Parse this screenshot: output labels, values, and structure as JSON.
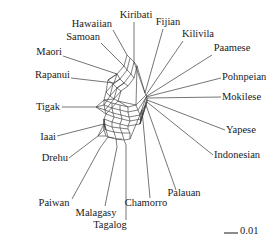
{
  "figure": {
    "type": "phylogenetic-split-network",
    "background_color": "#ffffff",
    "line_color": "#3a3a3a",
    "text_color": "#1a1a1a"
  },
  "chart_data": {
    "type": "scatter",
    "title": "",
    "xlabel": "",
    "ylabel": "",
    "grid": false,
    "legend": null,
    "network_style": "neighbor-net splits graph",
    "scale_bar": {
      "label": "0.01",
      "length_px": 14
    },
    "categories": [
      "Hawaiian",
      "Samoan",
      "Maori",
      "Rapanui",
      "Tigak",
      "Kiribati",
      "Fijian",
      "Kilivila",
      "Paamese",
      "Pohnpeian",
      "Mokilese",
      "Yapese",
      "Indonesian",
      "Palauan",
      "Chamorro",
      "Tagalog",
      "Malagasy",
      "Paiwan",
      "Drehu",
      "Iaai"
    ],
    "taxa": [
      {
        "name": "Hawaiian",
        "label_x": 112,
        "label_y": 27,
        "label_anchor": "right",
        "leader": [
          [
            113,
            30
          ],
          [
            127,
            55
          ]
        ],
        "tip": [
          127,
          55
        ]
      },
      {
        "name": "Samoan",
        "label_x": 100,
        "label_y": 40,
        "label_anchor": "right",
        "leader": [
          [
            101,
            43
          ],
          [
            124,
            66
          ]
        ],
        "tip": [
          124,
          66
        ]
      },
      {
        "name": "Maori",
        "label_x": 62,
        "label_y": 55,
        "label_anchor": "right",
        "leader": [
          [
            63,
            56
          ],
          [
            117,
            74
          ]
        ],
        "tip": [
          117,
          74
        ]
      },
      {
        "name": "Rapanui",
        "label_x": 70,
        "label_y": 78,
        "label_anchor": "right",
        "leader": [
          [
            71,
            78
          ],
          [
            114,
            83
          ]
        ],
        "tip": [
          114,
          83
        ]
      },
      {
        "name": "Tigak",
        "label_x": 60,
        "label_y": 110,
        "label_anchor": "right",
        "leader": [
          [
            62,
            107
          ],
          [
            96,
            107
          ]
        ],
        "tip": [
          96,
          107
        ]
      },
      {
        "name": "Kiribati",
        "label_x": 136,
        "label_y": 18,
        "label_anchor": "center",
        "leader": [
          [
            134,
            22
          ],
          [
            134,
            62
          ]
        ],
        "tip": [
          134,
          62
        ]
      },
      {
        "name": "Fijian",
        "label_x": 168,
        "label_y": 25,
        "label_anchor": "center",
        "leader": [
          [
            163,
            29
          ],
          [
            145,
            93
          ]
        ],
        "tip": [
          145,
          93
        ]
      },
      {
        "name": "Kilivila",
        "label_x": 198,
        "label_y": 37,
        "label_anchor": "center",
        "leader": [
          [
            183,
            41
          ],
          [
            146,
            95
          ]
        ],
        "tip": [
          146,
          95
        ]
      },
      {
        "name": "Paamese",
        "label_x": 232,
        "label_y": 51,
        "label_anchor": "center",
        "leader": [
          [
            212,
            55
          ],
          [
            147,
            96
          ]
        ],
        "tip": [
          147,
          96
        ]
      },
      {
        "name": "Pohnpeian",
        "label_x": 222,
        "label_y": 80,
        "label_anchor": "left",
        "leader": [
          [
            221,
            78
          ],
          [
            146,
            97
          ]
        ],
        "tip": [
          146,
          97
        ]
      },
      {
        "name": "Mokilese",
        "label_x": 222,
        "label_y": 100,
        "label_anchor": "left",
        "leader": [
          [
            221,
            97
          ],
          [
            147,
            98
          ]
        ],
        "tip": [
          147,
          98
        ]
      },
      {
        "name": "Yapese",
        "label_x": 226,
        "label_y": 133,
        "label_anchor": "left",
        "leader": [
          [
            225,
            130
          ],
          [
            147,
            100
          ]
        ],
        "tip": [
          147,
          100
        ]
      },
      {
        "name": "Indonesian",
        "label_x": 214,
        "label_y": 158,
        "label_anchor": "left",
        "leader": [
          [
            213,
            155
          ],
          [
            147,
            102
          ]
        ],
        "tip": [
          147,
          102
        ]
      },
      {
        "name": "Palauan",
        "label_x": 184,
        "label_y": 196,
        "label_anchor": "center",
        "leader": [
          [
            176,
            190
          ],
          [
            146,
            105
          ]
        ],
        "tip": [
          146,
          105
        ]
      },
      {
        "name": "Chamorro",
        "label_x": 146,
        "label_y": 206,
        "label_anchor": "center",
        "leader": [
          [
            150,
            198
          ],
          [
            142,
            110
          ]
        ],
        "tip": [
          142,
          110
        ]
      },
      {
        "name": "Tagalog",
        "label_x": 110,
        "label_y": 228,
        "label_anchor": "center",
        "leader": [
          [
            126,
            220
          ],
          [
            126,
            145
          ]
        ],
        "tip": [
          126,
          145
        ]
      },
      {
        "name": "Malagasy",
        "label_x": 96,
        "label_y": 216,
        "label_anchor": "center",
        "leader": [
          [
            105,
            206
          ],
          [
            117,
            147
          ]
        ],
        "tip": [
          117,
          147
        ]
      },
      {
        "name": "Paiwan",
        "label_x": 54,
        "label_y": 206,
        "label_anchor": "center",
        "leader": [
          [
            72,
            199
          ],
          [
            100,
            148
          ]
        ],
        "tip": [
          100,
          148
        ]
      },
      {
        "name": "Drehu",
        "label_x": 68,
        "label_y": 161,
        "label_anchor": "right",
        "leader": [
          [
            69,
            158
          ],
          [
            98,
            136
          ]
        ],
        "tip": [
          98,
          136
        ]
      },
      {
        "name": "Iaai",
        "label_x": 56,
        "label_y": 140,
        "label_anchor": "right",
        "leader": [
          [
            57,
            136
          ],
          [
            104,
            124
          ]
        ],
        "tip": [
          104,
          124
        ]
      }
    ]
  }
}
